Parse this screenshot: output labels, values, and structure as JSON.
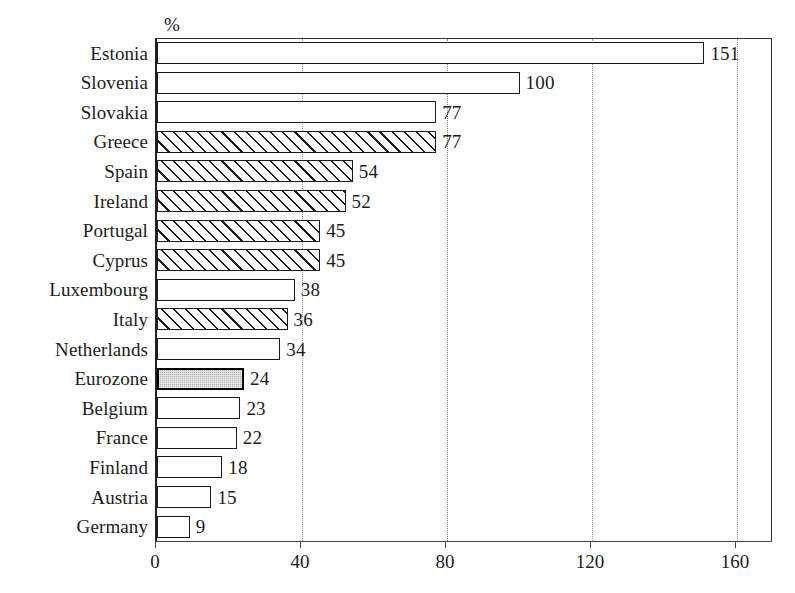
{
  "chart_data": {
    "type": "bar",
    "orientation": "horizontal",
    "title": "",
    "subtitle": "",
    "xlabel": "",
    "ylabel": "",
    "unit_label": "%",
    "xlim": [
      0,
      168
    ],
    "xticks": [
      0,
      40,
      80,
      120,
      160
    ],
    "xtick_labels": [
      "0",
      "40",
      "80",
      "120",
      "160"
    ],
    "grid": "vertical-dotted",
    "legend": "none",
    "categories": [
      "Estonia",
      "Slovenia",
      "Slovakia",
      "Greece",
      "Spain",
      "Ireland",
      "Portugal",
      "Cyprus",
      "Luxembourg",
      "Italy",
      "Netherlands",
      "Eurozone",
      "Belgium",
      "France",
      "Finland",
      "Austria",
      "Germany"
    ],
    "values": [
      151,
      100,
      77,
      77,
      54,
      52,
      45,
      45,
      38,
      36,
      34,
      24,
      23,
      22,
      18,
      15,
      9
    ],
    "value_labels": [
      "151",
      "100",
      "77",
      "77",
      "54",
      "52",
      "45",
      "45",
      "38",
      "36",
      "34",
      "24",
      "23",
      "22",
      "18",
      "15",
      "9"
    ],
    "fills": [
      "white",
      "white",
      "white",
      "hatched",
      "hatched",
      "hatched",
      "hatched",
      "hatched",
      "white",
      "hatched",
      "white",
      "stippled",
      "white",
      "white",
      "white",
      "white",
      "white"
    ],
    "bars": [
      {
        "category": "Estonia",
        "value": 151,
        "label": "151",
        "fill": "white"
      },
      {
        "category": "Slovenia",
        "value": 100,
        "label": "100",
        "fill": "white"
      },
      {
        "category": "Slovakia",
        "value": 77,
        "label": "77",
        "fill": "white"
      },
      {
        "category": "Greece",
        "value": 77,
        "label": "77",
        "fill": "hatched"
      },
      {
        "category": "Spain",
        "value": 54,
        "label": "54",
        "fill": "hatched"
      },
      {
        "category": "Ireland",
        "value": 52,
        "label": "52",
        "fill": "hatched"
      },
      {
        "category": "Portugal",
        "value": 45,
        "label": "45",
        "fill": "hatched"
      },
      {
        "category": "Cyprus",
        "value": 45,
        "label": "45",
        "fill": "hatched"
      },
      {
        "category": "Luxembourg",
        "value": 38,
        "label": "38",
        "fill": "white"
      },
      {
        "category": "Italy",
        "value": 36,
        "label": "36",
        "fill": "hatched"
      },
      {
        "category": "Netherlands",
        "value": 34,
        "label": "34",
        "fill": "white"
      },
      {
        "category": "Eurozone",
        "value": 24,
        "label": "24",
        "fill": "stippled"
      },
      {
        "category": "Belgium",
        "value": 23,
        "label": "23",
        "fill": "white"
      },
      {
        "category": "France",
        "value": 22,
        "label": "22",
        "fill": "white"
      },
      {
        "category": "Finland",
        "value": 18,
        "label": "18",
        "fill": "white"
      },
      {
        "category": "Austria",
        "value": 15,
        "label": "15",
        "fill": "white"
      },
      {
        "category": "Germany",
        "value": 9,
        "label": "9",
        "fill": "white"
      }
    ],
    "colors": {
      "axis": "#222222",
      "bar_outline": "#1a1a1a",
      "bar_white_fill": "#ffffff",
      "bar_hatch": "#1d1d1d",
      "bar_stipple_fill": "#b3b3b3",
      "gridline": "#9a9a9a",
      "text": "#1c1c1c",
      "background": "#ffffff"
    }
  },
  "layout": {
    "plot_left": 155,
    "plot_top": 38,
    "plot_width": 617,
    "plot_height": 504,
    "px_per_unit": 3.625,
    "row_pitch": 29.6,
    "bar_height": 22,
    "first_row_top": 41
  }
}
